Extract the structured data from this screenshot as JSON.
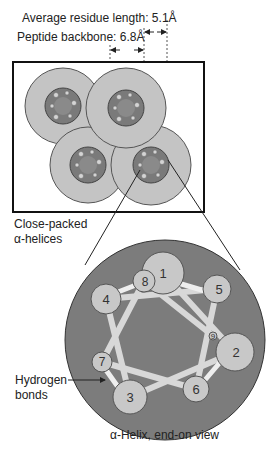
{
  "labels": {
    "residue_length": "Average residue length: 5.1Å",
    "backbone": "Peptide backbone: 6.8Å",
    "close_packed_line1": "Close-packed",
    "close_packed_line2": "α-helices",
    "hbonds_line1": "Hydrogen",
    "hbonds_line2": "bonds",
    "caption": "α-Helix, end-on view"
  },
  "residues": [
    {
      "n": "1",
      "x": 163,
      "y": 273,
      "r": 21
    },
    {
      "n": "2",
      "x": 235,
      "y": 352,
      "r": 19
    },
    {
      "n": "3",
      "x": 130,
      "y": 397,
      "r": 17
    },
    {
      "n": "4",
      "x": 106,
      "y": 299,
      "r": 15
    },
    {
      "n": "5",
      "x": 217,
      "y": 289,
      "r": 14
    },
    {
      "n": "6",
      "x": 196,
      "y": 389,
      "r": 13
    },
    {
      "n": "7",
      "x": 102,
      "y": 362,
      "r": 10
    },
    {
      "n": "8",
      "x": 144,
      "y": 281,
      "r": 11
    },
    {
      "n": "9",
      "x": 213,
      "y": 336,
      "r": 4
    }
  ],
  "colors": {
    "outer_helix": "#c4c4c4",
    "inner_helix": "#7a7a7a",
    "end_on_disc": "#7c7c7c",
    "residue": "#c8c8c8",
    "rod": "#d8d8d8",
    "ink": "#222222"
  }
}
